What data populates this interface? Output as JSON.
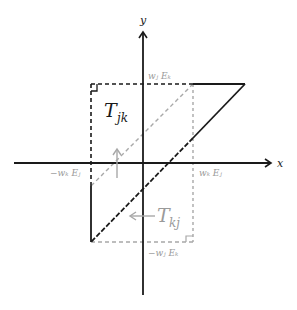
{
  "diagram": {
    "axes": {
      "x_label": "x",
      "y_label": "y"
    },
    "labels": {
      "top_tick": "wⱼ Eₖ",
      "bottom_tick": "−wⱼ Eₖ",
      "left_tick": "−wₖ Eⱼ",
      "right_tick": "wₖ Eⱼ",
      "region_black": "T",
      "region_black_sub": "jk",
      "region_gray": "T",
      "region_gray_sub": "kj"
    },
    "colors": {
      "black": "#1a1a1a",
      "gray": "#a8a8a8",
      "gray_text": "#9a9a9a"
    }
  }
}
